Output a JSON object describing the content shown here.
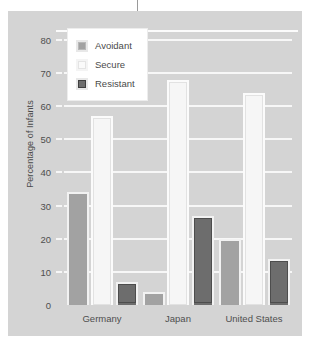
{
  "chart_data": {
    "type": "bar",
    "title": "",
    "xlabel": "",
    "ylabel": "Percentage of Infants",
    "ylim": [
      0,
      83
    ],
    "yticks": [
      0,
      10,
      20,
      30,
      40,
      50,
      60,
      70,
      80
    ],
    "grid": true,
    "legend_position": "top-left",
    "categories": [
      "Germany",
      "Japan",
      "United States"
    ],
    "series": [
      {
        "name": "Avoidant",
        "color": "#a2a2a2",
        "values": [
          34,
          4,
          20
        ]
      },
      {
        "name": "Secure",
        "color": "#f6f6f6",
        "values": [
          57,
          68,
          64
        ]
      },
      {
        "name": "Resistant",
        "color": "#6d6d6d",
        "values": [
          7,
          27,
          14
        ]
      }
    ]
  },
  "legend": {
    "items": [
      {
        "label": "Avoidant",
        "swatch": "avoidant-swatch-icon"
      },
      {
        "label": "Secure",
        "swatch": "secure-swatch-icon"
      },
      {
        "label": "Resistant",
        "swatch": "resistant-swatch-icon"
      }
    ]
  },
  "colors": {
    "plot_background": "#d4d4d4",
    "gridline": "#f7f7f7",
    "text": "#4a4a4a"
  }
}
